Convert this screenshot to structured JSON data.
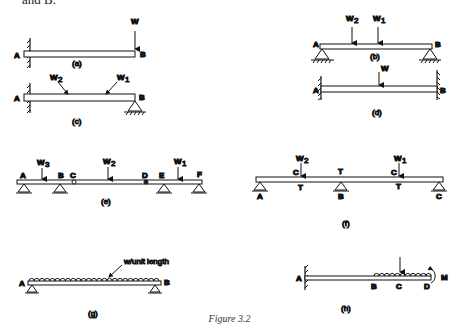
{
  "intro_text": "and B.",
  "caption": "Figure 3.2",
  "diagrams": {
    "a": {
      "label": "(a)",
      "points": [
        "A",
        "B"
      ],
      "loads": [
        "W"
      ],
      "supports": "fixed at A, free at B"
    },
    "b": {
      "label": "(b)",
      "points": [
        "A",
        "B"
      ],
      "loads": [
        "W2",
        "W1"
      ],
      "supports": "pinned at A and B"
    },
    "c": {
      "label": "(c)",
      "points": [
        "A",
        "B"
      ],
      "loads": [
        "W2",
        "W1"
      ],
      "supports": "fixed at A, pinned at B"
    },
    "d": {
      "label": "(d)",
      "points": [
        "A",
        "B"
      ],
      "loads": [
        "W"
      ],
      "supports": "fixed at A and B"
    },
    "e": {
      "label": "(e)",
      "points": [
        "A",
        "B",
        "C",
        "D",
        "E",
        "F"
      ],
      "loads": [
        "W3",
        "W2",
        "W1"
      ],
      "supports": "pins at A, B, E, F; hinges at C, D"
    },
    "f": {
      "label": "(f)",
      "points": [
        "A",
        "B",
        "C"
      ],
      "loads": [
        "W2",
        "W1"
      ],
      "annotations": [
        "C",
        "T",
        "T",
        "C",
        "T",
        "T"
      ],
      "supports": "pins at A, B, C"
    },
    "g": {
      "label": "(g)",
      "points": [
        "A",
        "B"
      ],
      "loads": [
        "w/unit length"
      ],
      "supports": "pinned at A and B"
    },
    "h": {
      "label": "(h)",
      "points": [
        "A",
        "B",
        "C",
        "D"
      ],
      "loads": [
        "M"
      ],
      "supports": "fixed at A"
    }
  },
  "labels": {
    "A": "A",
    "B": "B",
    "C": "C",
    "D": "D",
    "E": "E",
    "F": "F",
    "T": "T",
    "M": "M",
    "W": "W",
    "W1": "W",
    "W2": "W",
    "W3": "W",
    "s1": "1",
    "s2": "2",
    "s3": "3",
    "udl": "w/unit length",
    "a": "(a)",
    "b": "(b)",
    "c": "(c)",
    "d": "(d)",
    "e": "(e)",
    "f": "(f)",
    "g": "(g)",
    "h": "(h)"
  }
}
